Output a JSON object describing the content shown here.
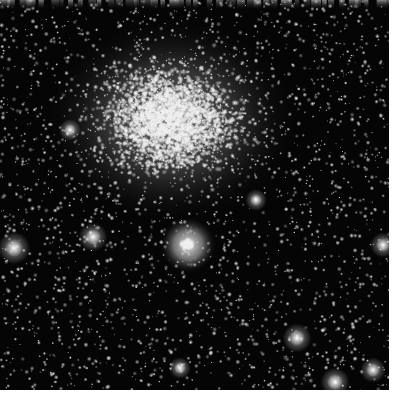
{
  "image": {
    "subject": "globular star cluster",
    "description": "Dense globular star cluster on a black sky background with a bright diffuse core in the upper-left center and a compact bright knot of stars below it",
    "background_color": "#050505",
    "margin_color": "#ffffff",
    "frame": {
      "width": 389,
      "height": 390
    },
    "core": {
      "cx": 170,
      "cy": 120,
      "rx": 130,
      "ry": 105
    },
    "knot": {
      "cx": 188,
      "cy": 245,
      "r": 18
    },
    "bright_stars": [
      {
        "x": 14,
        "y": 248,
        "r": 9
      },
      {
        "x": 93,
        "y": 237,
        "r": 8
      },
      {
        "x": 297,
        "y": 338,
        "r": 8
      },
      {
        "x": 335,
        "y": 382,
        "r": 8
      },
      {
        "x": 373,
        "y": 370,
        "r": 7
      },
      {
        "x": 383,
        "y": 245,
        "r": 7
      },
      {
        "x": 256,
        "y": 200,
        "r": 6
      },
      {
        "x": 180,
        "y": 368,
        "r": 6
      },
      {
        "x": 70,
        "y": 130,
        "r": 6
      }
    ]
  }
}
